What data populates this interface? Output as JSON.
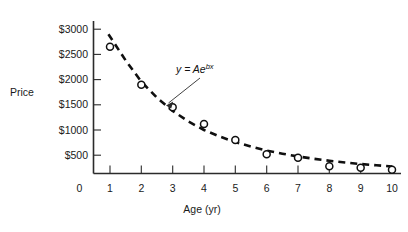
{
  "chart_data": {
    "type": "scatter",
    "title": "",
    "xlabel": "Age (yr)",
    "ylabel": "Price",
    "xlim": [
      0,
      10.6
    ],
    "ylim": [
      0,
      3250
    ],
    "grid": false,
    "legend": "none",
    "x_ticks": [
      "0",
      "1",
      "2",
      "3",
      "4",
      "5",
      "6",
      "7",
      "8",
      "9",
      "10"
    ],
    "x_tick_values": [
      0,
      1,
      2,
      3,
      4,
      5,
      6,
      7,
      8,
      9,
      10
    ],
    "y_ticks": [
      "$500",
      "$1000",
      "$1500",
      "$2000",
      "$2500",
      "$3000"
    ],
    "y_tick_values": [
      500,
      1000,
      1500,
      2000,
      2500,
      3000
    ],
    "series": [
      {
        "name": "observed-prices",
        "marker": "open-circle",
        "x": [
          1,
          2,
          3,
          4,
          5,
          6,
          7,
          8,
          9,
          10
        ],
        "values": [
          2650,
          1900,
          1450,
          1120,
          800,
          520,
          450,
          280,
          250,
          210
        ]
      },
      {
        "name": "exponential-fit",
        "style": "dashed-curve",
        "equation": "y = Ae",
        "equation_exponent": "bx",
        "x": [
          0.95,
          1.5,
          2,
          2.5,
          3,
          3.5,
          4,
          4.5,
          5,
          5.5,
          6,
          6.5,
          7,
          7.5,
          8,
          8.5,
          9,
          9.5,
          10
        ],
        "values": [
          2900,
          2380,
          1960,
          1640,
          1380,
          1170,
          1000,
          870,
          760,
          670,
          590,
          530,
          475,
          430,
          390,
          355,
          325,
          300,
          275
        ]
      }
    ],
    "annotations": [
      {
        "name": "fit-equation",
        "text": "y = Ae",
        "superscript": "bx",
        "points_to_x": 2.65,
        "points_to_y": 1240
      }
    ],
    "colors": {
      "axis": "#2b2b2b",
      "curve": "#101010",
      "marker_fill": "#ffffff",
      "marker_stroke": "#101010",
      "text": "#1a1a1a",
      "background": "#ffffff"
    }
  }
}
